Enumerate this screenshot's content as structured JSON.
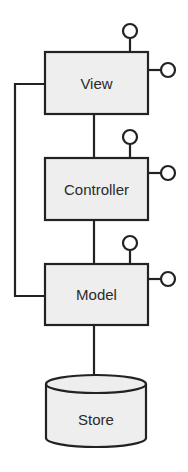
{
  "diagram": {
    "type": "architecture",
    "colors": {
      "stroke": "#222222",
      "fill": "#eeeeee",
      "background": "#ffffff"
    },
    "nodes": [
      {
        "id": "view",
        "label": "View",
        "shape": "rectangle",
        "interfaces": 2
      },
      {
        "id": "controller",
        "label": "Controller",
        "shape": "rectangle",
        "interfaces": 2
      },
      {
        "id": "model",
        "label": "Model",
        "shape": "rectangle",
        "interfaces": 2
      },
      {
        "id": "store",
        "label": "Store",
        "shape": "cylinder",
        "interfaces": 0
      }
    ],
    "edges": [
      {
        "from": "view",
        "to": "controller"
      },
      {
        "from": "controller",
        "to": "model"
      },
      {
        "from": "view",
        "to": "model",
        "route": "left-side"
      },
      {
        "from": "model",
        "to": "store"
      }
    ]
  }
}
